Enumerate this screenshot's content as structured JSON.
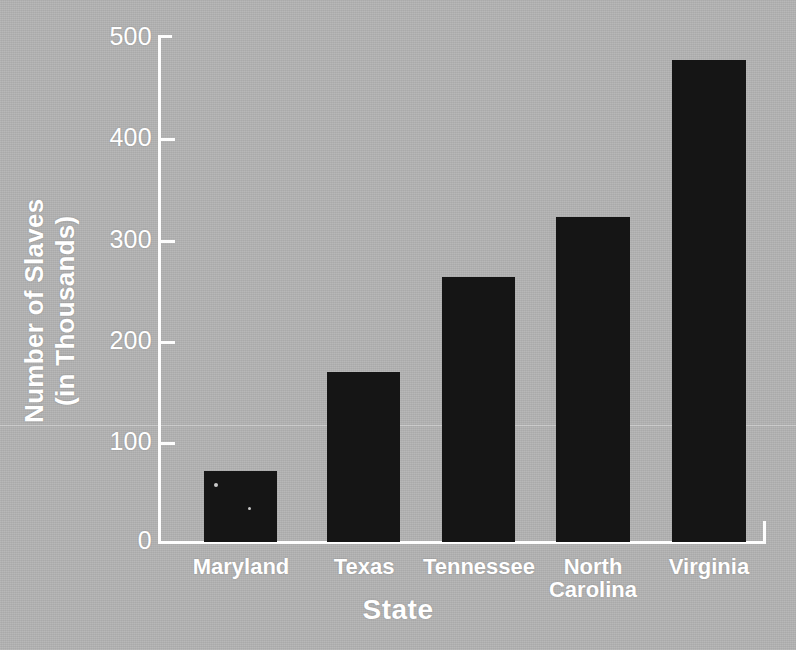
{
  "chart_data": {
    "type": "bar",
    "title": "",
    "xlabel": "State",
    "ylabel": "Number of Slaves (in Thousands)",
    "ylabel_line1": "Number of Slaves",
    "ylabel_line2": "(in Thousands)",
    "categories": [
      "Maryland",
      "Texas",
      "Tennessee",
      "North Carolina",
      "Virginia"
    ],
    "category_labels": [
      {
        "line1": "Maryland",
        "line2": ""
      },
      {
        "line1": "Texas",
        "line2": ""
      },
      {
        "line1": "Tennessee",
        "line2": ""
      },
      {
        "line1": "North",
        "line2": "Carolina"
      },
      {
        "line1": "Virginia",
        "line2": ""
      }
    ],
    "values": [
      70,
      168,
      262,
      322,
      477
    ],
    "ylim": [
      0,
      500
    ],
    "yticks": [
      500,
      400,
      300,
      200,
      100,
      0
    ],
    "ytick_labels": [
      "500",
      "400",
      "300",
      "200",
      "100",
      "0"
    ],
    "grid": false,
    "legend": null,
    "colors": {
      "background": "#b3b3b3",
      "bar": "#151515",
      "axis": "#fdfdfd",
      "text": "#ffffff"
    }
  }
}
